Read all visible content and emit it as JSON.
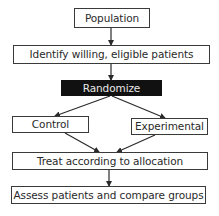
{
  "diagram": {
    "type": "flowchart",
    "colors": {
      "box_border": "#3a3a3a",
      "box_fill": "#ffffff",
      "highlight_fill": "#111111",
      "highlight_text": "#e8e8e8",
      "text": "#2a2a2a",
      "arrow": "#2a2a2a"
    },
    "nodes": {
      "population": {
        "label": "Population"
      },
      "identify": {
        "label": "Identify willing, eligible patients"
      },
      "randomize": {
        "label": "Randomize"
      },
      "control": {
        "label": "Control"
      },
      "experimental": {
        "label": "Experimental"
      },
      "treat": {
        "label": "Treat according to allocation"
      },
      "assess": {
        "label": "Assess patients and compare groups"
      }
    },
    "edges": [
      {
        "from": "population",
        "to": "identify"
      },
      {
        "from": "identify",
        "to": "randomize"
      },
      {
        "from": "randomize",
        "to": "control"
      },
      {
        "from": "randomize",
        "to": "experimental"
      },
      {
        "from": "control",
        "to": "treat"
      },
      {
        "from": "experimental",
        "to": "treat"
      },
      {
        "from": "treat",
        "to": "assess"
      }
    ]
  }
}
